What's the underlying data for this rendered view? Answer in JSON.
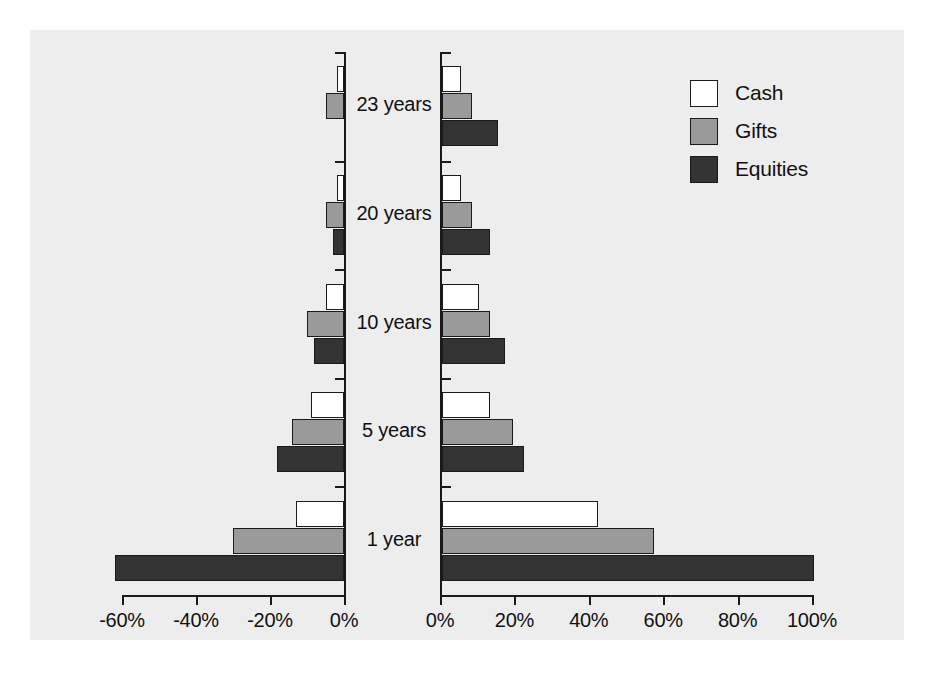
{
  "legend": {
    "position": "top-right",
    "items": [
      {
        "label": "Cash",
        "key": "cash",
        "color": "#ffffff"
      },
      {
        "label": "Gifts",
        "key": "gifts",
        "color": "#9a9a9a"
      },
      {
        "label": "Equities",
        "key": "equities",
        "color": "#333333"
      }
    ]
  },
  "axis": {
    "left_ticks": [
      "-60%",
      "-40%",
      "-20%",
      "0%"
    ],
    "right_ticks": [
      "0%",
      "20%",
      "40%",
      "60%",
      "80%",
      "100%"
    ]
  },
  "categories": [
    "23 years",
    "20 years",
    "10 years",
    "5 years",
    "1 year"
  ],
  "colors": {
    "cash": "#ffffff",
    "gifts": "#9a9a9a",
    "equities": "#333333",
    "background": "#ededed",
    "axis": "#1a1a1a",
    "text": "#111111"
  },
  "caption": "",
  "chart_data": {
    "type": "bar",
    "orientation": "horizontal",
    "layout": "back-to-back dual panel, grouped bars, shared category axis in centre gutter",
    "title": "",
    "xlabel": "",
    "ylabel": "",
    "grid": false,
    "legend_position": "top-right",
    "categories": [
      "23 years",
      "20 years",
      "10 years",
      "5 years",
      "1 year"
    ],
    "panels": [
      {
        "name": "left",
        "xlim": [
          -60,
          0
        ],
        "ticks": [
          -60,
          -40,
          -20,
          0
        ],
        "tick_labels": [
          "-60%",
          "-40%",
          "-20%",
          "0%"
        ],
        "series": [
          {
            "name": "Cash",
            "values": [
              -2,
              -2,
              -5,
              -9,
              -13
            ]
          },
          {
            "name": "Gifts",
            "values": [
              -5,
              -5,
              -10,
              -14,
              -30
            ]
          },
          {
            "name": "Equities",
            "values": [
              0,
              -3,
              -8,
              -18,
              -62
            ]
          }
        ]
      },
      {
        "name": "right",
        "xlim": [
          0,
          100
        ],
        "ticks": [
          0,
          20,
          40,
          60,
          80,
          100
        ],
        "tick_labels": [
          "0%",
          "20%",
          "40%",
          "60%",
          "80%",
          "100%"
        ],
        "series": [
          {
            "name": "Cash",
            "values": [
              5,
              5,
              10,
              13,
              42
            ]
          },
          {
            "name": "Gifts",
            "values": [
              8,
              8,
              13,
              19,
              57
            ]
          },
          {
            "name": "Equities",
            "values": [
              15,
              13,
              17,
              22,
              100
            ]
          }
        ]
      }
    ]
  }
}
